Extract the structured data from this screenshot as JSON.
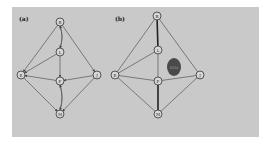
{
  "figure": {
    "panels": [
      {
        "label": "(a)",
        "nodes": [
          {
            "id": "top",
            "label": "R"
          },
          {
            "id": "upper",
            "label": "L"
          },
          {
            "id": "left",
            "label": "E"
          },
          {
            "id": "center",
            "label": "F"
          },
          {
            "id": "right",
            "label": "J"
          },
          {
            "id": "bottom",
            "label": "M"
          }
        ],
        "edges": [
          {
            "from": "top",
            "to": "left",
            "directed": true
          },
          {
            "from": "top",
            "to": "right",
            "directed": true
          },
          {
            "from": "top",
            "to": "upper",
            "directed": true,
            "curved": "left"
          },
          {
            "from": "upper",
            "to": "top",
            "directed": true,
            "curved": "right"
          },
          {
            "from": "upper",
            "to": "left",
            "directed": true
          },
          {
            "from": "upper",
            "to": "center",
            "directed": true
          },
          {
            "from": "center",
            "to": "left",
            "directed": true
          },
          {
            "from": "right",
            "to": "center",
            "directed": true
          },
          {
            "from": "center",
            "to": "bottom",
            "directed": true,
            "curved": "left"
          },
          {
            "from": "bottom",
            "to": "center",
            "directed": true,
            "curved": "right"
          },
          {
            "from": "left",
            "to": "bottom",
            "directed": true
          },
          {
            "from": "right",
            "to": "bottom",
            "directed": true
          }
        ]
      },
      {
        "label": "(b)",
        "nodes": [
          {
            "id": "top",
            "label": "R"
          },
          {
            "id": "upper",
            "label": "L"
          },
          {
            "id": "left",
            "label": "E"
          },
          {
            "id": "center",
            "label": "F"
          },
          {
            "id": "right",
            "label": "J"
          },
          {
            "id": "bottom",
            "label": "M"
          }
        ],
        "edges": [
          {
            "from": "top",
            "to": "left"
          },
          {
            "from": "top",
            "to": "right"
          },
          {
            "from": "top",
            "to": "upper",
            "thick": true
          },
          {
            "from": "upper",
            "to": "left"
          },
          {
            "from": "upper",
            "to": "center"
          },
          {
            "from": "left",
            "to": "center"
          },
          {
            "from": "center",
            "to": "right"
          },
          {
            "from": "center",
            "to": "bottom",
            "thick": true
          },
          {
            "from": "left",
            "to": "bottom"
          },
          {
            "from": "right",
            "to": "bottom"
          }
        ],
        "blob": {
          "label": "DYM"
        }
      }
    ]
  }
}
